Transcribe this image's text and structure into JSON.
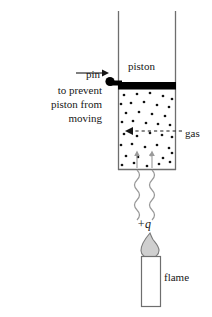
{
  "figure": {
    "labels": {
      "pin": "pin",
      "prevent_line1": "to prevent",
      "prevent_line2": "piston from",
      "prevent_line3": "moving",
      "piston": "piston",
      "gas": "gas",
      "heat": "+q",
      "flame": "flame"
    },
    "colors": {
      "ink": "#171717",
      "piston_fill": "#000000",
      "wall_stroke": "#6e6e6e",
      "dot_fill": "#111111",
      "heat_wave": "#9a9a9a",
      "flame_fill": "#cfcfcf",
      "flame_stroke": "#7a7a7a",
      "candle_fill": "#ffffff",
      "candle_stroke": "#6e6e6e",
      "background": "#ffffff"
    },
    "geometry": {
      "cylinder_left_x": 118,
      "cylinder_right_x": 176,
      "cylinder_top_y": 11,
      "cylinder_bottom_y": 170,
      "piston_top_y": 82,
      "piston_bottom_y": 89,
      "pin_center_x": 110,
      "pin_center_y": 85,
      "candle_left_x": 141,
      "candle_right_x": 160,
      "candle_top_y": 256,
      "candle_bottom_y": 307
    },
    "gas_dots": [
      [
        124,
        95
      ],
      [
        137,
        94
      ],
      [
        150,
        93
      ],
      [
        163,
        96
      ],
      [
        172,
        99
      ],
      [
        120,
        104
      ],
      [
        131,
        103
      ],
      [
        144,
        102
      ],
      [
        157,
        105
      ],
      [
        169,
        107
      ],
      [
        126,
        113
      ],
      [
        139,
        112
      ],
      [
        152,
        114
      ],
      [
        165,
        116
      ],
      [
        121,
        122
      ],
      [
        133,
        121
      ],
      [
        146,
        123
      ],
      [
        158,
        124
      ],
      [
        170,
        125
      ],
      [
        124,
        134
      ],
      [
        137,
        136
      ],
      [
        150,
        133
      ],
      [
        162,
        135
      ],
      [
        172,
        137
      ],
      [
        121,
        145
      ],
      [
        132,
        144
      ],
      [
        145,
        147
      ],
      [
        157,
        145
      ],
      [
        169,
        148
      ],
      [
        126,
        156
      ],
      [
        138,
        157
      ],
      [
        151,
        155
      ],
      [
        163,
        158
      ],
      [
        172,
        153
      ],
      [
        122,
        165
      ],
      [
        134,
        163
      ],
      [
        147,
        166
      ],
      [
        159,
        164
      ],
      [
        170,
        162
      ]
    ],
    "heat_waves": [
      {
        "x": 137,
        "top": 170,
        "bottom": 215
      },
      {
        "x": 152,
        "top": 170,
        "bottom": 215
      }
    ],
    "inner_arrows": [
      {
        "x": 137,
        "from_y": 168,
        "to_y": 152
      },
      {
        "x": 152,
        "from_y": 168,
        "to_y": 152
      }
    ],
    "gas_pointer": {
      "dashed_from_x": 182,
      "dashed_to_x": 126,
      "y": 131
    },
    "pin_pointer": {
      "from_x": 76,
      "to_x": 105,
      "y": 72
    }
  }
}
